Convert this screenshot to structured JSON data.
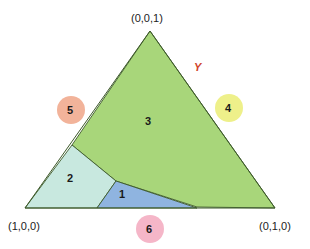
{
  "vertices": {
    "top": "(0,0,1)",
    "left": "(1,0,0)",
    "right": "(0,1,0)"
  },
  "edge_label": "Y",
  "regions": [
    {
      "id": "1",
      "label": "1",
      "color": "#8fb4e0"
    },
    {
      "id": "2",
      "label": "2",
      "color": "#c8e8df"
    },
    {
      "id": "3",
      "label": "3",
      "color": "#a8d67a"
    }
  ],
  "circles": [
    {
      "id": "4",
      "label": "4",
      "color": "#eef08a"
    },
    {
      "id": "5",
      "label": "5",
      "color": "#f2b39a"
    },
    {
      "id": "6",
      "label": "6",
      "color": "#f5b6c8"
    }
  ],
  "colors": {
    "outline": "#3d5a2a",
    "edge_label": "#d0452a"
  }
}
